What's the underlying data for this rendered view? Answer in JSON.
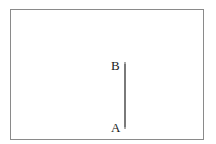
{
  "diagram": {
    "points": [
      {
        "label": "B",
        "x": 125,
        "y": 63
      },
      {
        "label": "A",
        "x": 125,
        "y": 128
      }
    ],
    "segment": {
      "from": "A",
      "to": "B",
      "orientation": "vertical"
    }
  }
}
